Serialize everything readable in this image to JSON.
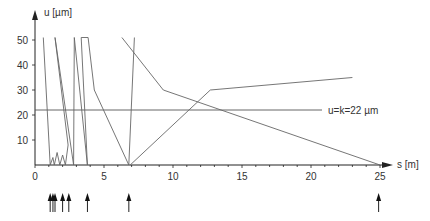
{
  "chart_data": {
    "type": "line",
    "title": "",
    "xlabel": "s [m]",
    "ylabel": "u [µm]",
    "xlim": [
      0,
      25
    ],
    "ylim": [
      0,
      50
    ],
    "x_ticks": [
      "0",
      "5",
      "10",
      "15",
      "20",
      "25"
    ],
    "y_ticks": [
      "10",
      "20",
      "30",
      "40",
      "50"
    ],
    "grid": false,
    "reference_line": {
      "label": "u=k=22 µm",
      "value": 22
    },
    "series": [
      {
        "name": "trajectory",
        "note": "Approximate path. The overall shape and vertex positions were estimated from zoomed views; the ordering of segments in the dense cluster near s=0.7-3 m could not be resolved at this resolution.",
        "points": [
          [
            0.6,
            51
          ],
          [
            1.1,
            0
          ],
          [
            1.3,
            3
          ],
          [
            1.4,
            0
          ],
          [
            1.6,
            5
          ],
          [
            1.8,
            0
          ],
          [
            2.0,
            4
          ],
          [
            2.2,
            0
          ],
          [
            2.4,
            8
          ],
          [
            1.45,
            51
          ],
          [
            2.8,
            0
          ],
          [
            2.85,
            51
          ],
          [
            3.8,
            0
          ],
          [
            3.35,
            51
          ],
          [
            3.85,
            51
          ],
          [
            4.3,
            30
          ],
          [
            6.8,
            0
          ],
          [
            7.2,
            51
          ]
        ]
      },
      {
        "name": "descending",
        "points": [
          [
            6.3,
            51
          ],
          [
            9.3,
            30
          ],
          [
            25,
            0
          ]
        ]
      },
      {
        "name": "ascending",
        "points": [
          [
            6.9,
            0
          ],
          [
            12.7,
            30
          ],
          [
            23,
            35
          ]
        ]
      }
    ],
    "event_arrows_s": [
      1.1,
      1.3,
      1.45,
      2.0,
      2.45,
      3.8,
      6.8,
      24.9
    ]
  },
  "axis": {
    "x_label": "s [m]",
    "y_label": "u [µm]",
    "x_ticks": [
      "0",
      "5",
      "10",
      "15",
      "20",
      "25"
    ],
    "y_ticks": [
      "10",
      "20",
      "30",
      "40",
      "50"
    ]
  },
  "reference": {
    "label": "u=k=22 µm"
  }
}
